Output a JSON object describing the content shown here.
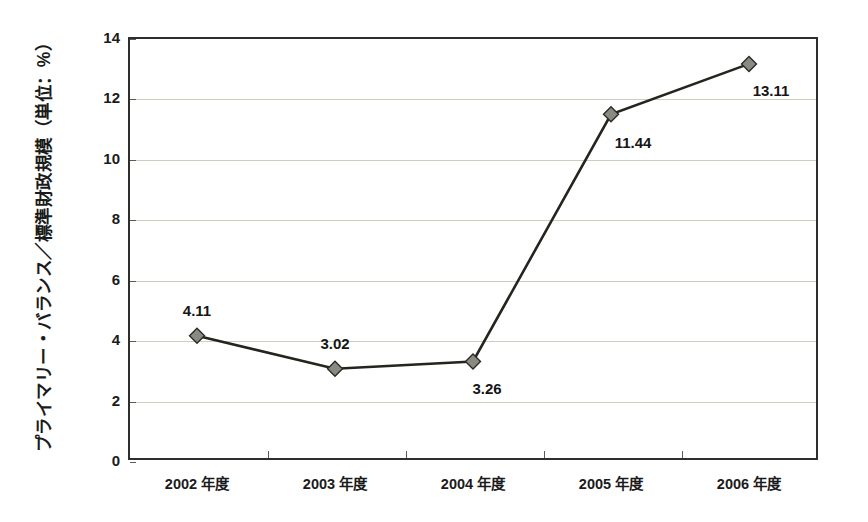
{
  "chart_data": {
    "type": "line",
    "title": "",
    "subtitle": "",
    "xlabel": "",
    "ylabel": "プライマリー・バランス／標準財政規模（単位：%）",
    "categories": [
      "2002 年度",
      "2003 年度",
      "2004 年度",
      "2005 年度",
      "2006 年度"
    ],
    "values": [
      4.11,
      3.02,
      3.26,
      11.44,
      13.11
    ],
    "point_labels": [
      "4.11",
      "3.02",
      "3.26",
      "11.44",
      "13.11"
    ],
    "series": [
      {
        "name": "プライマリー・バランス／標準財政規模",
        "values": [
          4.11,
          3.02,
          3.26,
          11.44,
          13.11
        ],
        "line_color": "#25251f",
        "marker_fill": "#8a8a82",
        "marker_edge": "#2b2b25",
        "marker": "diamond"
      }
    ],
    "ylim": [
      0,
      14
    ],
    "y_ticks": [
      0,
      2,
      4,
      6,
      8,
      10,
      12,
      14
    ],
    "y_tick_labels": [
      "0",
      "2",
      "4",
      "6",
      "8",
      "10",
      "12",
      "14"
    ],
    "grid": true,
    "grid_axis": "y",
    "grid_color": "#cfcdc2",
    "legend": false,
    "legend_position": "none",
    "frame_color": "#2e2e2c",
    "background_color": "#ffffff"
  },
  "label_offsets": [
    {
      "dx": 0,
      "dy": -26
    },
    {
      "dx": 0,
      "dy": -26
    },
    {
      "dx": 14,
      "dy": 26
    },
    {
      "dx": 22,
      "dy": 28
    },
    {
      "dx": 22,
      "dy": 26
    }
  ]
}
